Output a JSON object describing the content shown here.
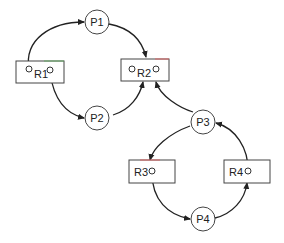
{
  "diagram": {
    "type": "resource-allocation-graph",
    "processes": [
      {
        "id": "P1",
        "label": "P1"
      },
      {
        "id": "P2",
        "label": "P2"
      },
      {
        "id": "P3",
        "label": "P3"
      },
      {
        "id": "P4",
        "label": "P4"
      }
    ],
    "resources": [
      {
        "id": "R1",
        "label": "R1",
        "instances": 2
      },
      {
        "id": "R2",
        "label": "R2",
        "instances": 2
      },
      {
        "id": "R3",
        "label": "R3",
        "instances": 1
      },
      {
        "id": "R4",
        "label": "R4",
        "instances": 1
      }
    ],
    "edges": [
      {
        "from": "R1",
        "to": "P1"
      },
      {
        "from": "P1",
        "to": "R2"
      },
      {
        "from": "R1",
        "to": "P2"
      },
      {
        "from": "P2",
        "to": "R2"
      },
      {
        "from": "P3",
        "to": "R2"
      },
      {
        "from": "P3",
        "to": "R3"
      },
      {
        "from": "R3",
        "to": "P4"
      },
      {
        "from": "P4",
        "to": "R4"
      },
      {
        "from": "R4",
        "to": "P3"
      }
    ]
  }
}
